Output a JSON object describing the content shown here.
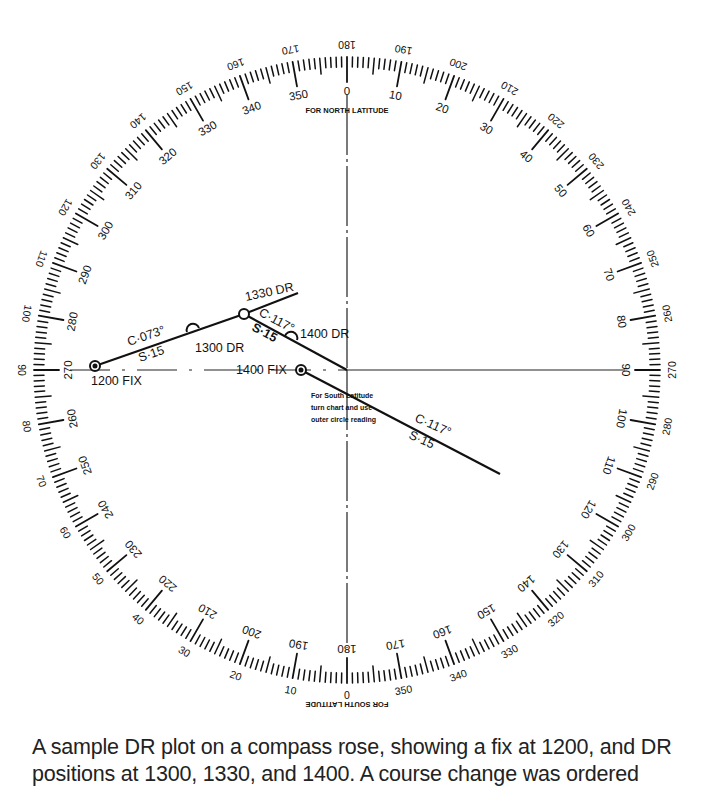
{
  "diagram": {
    "type": "compass-rose-dr-plot",
    "center": [
      347,
      370
    ],
    "ring": {
      "inner_labels_degrees": [
        0,
        10,
        20,
        30,
        40,
        50,
        60,
        70,
        80,
        90,
        100,
        110,
        120,
        130,
        140,
        150,
        160,
        170,
        180,
        190,
        200,
        210,
        220,
        230,
        240,
        250,
        260,
        270,
        280,
        290,
        300,
        310,
        320,
        330,
        340,
        350
      ],
      "outer_labels_note": "outer circle reading = inner + 180 (upside down)",
      "north_label": "FOR NORTH LATITUDE",
      "south_label": "FOR SOUTH LATITUDE"
    },
    "plot": {
      "fix_1200": "1200 FIX",
      "dr_1300": "1300 DR",
      "dr_1330": "1330 DR",
      "dr_1400": "1400 DR",
      "fix_1400": "1400 FIX",
      "leg1_course": "C·073°",
      "leg1_speed": "S·15",
      "leg2_course": "C·117°",
      "leg2_speed": "S·15",
      "leg3_course": "C·117°",
      "leg3_speed": "S·15",
      "note_lines": [
        "For South Latitude",
        "turn chart and use",
        "outer circle reading"
      ]
    }
  },
  "caption": {
    "line1": "A sample DR plot on a compass rose, showing a fix at 1200, and DR",
    "line2": "positions at 1300, 1330, and 1400. A course change was ordered"
  }
}
